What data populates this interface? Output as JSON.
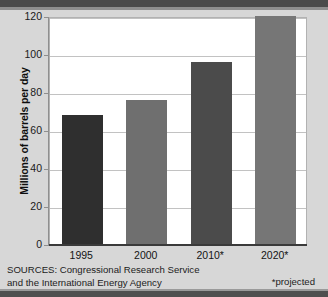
{
  "chart_data": {
    "type": "bar",
    "title": "",
    "subtitle": "",
    "xlabel": "",
    "ylabel": "Millions of barrels per day",
    "categories": [
      "1995",
      "2000",
      "2010*",
      "2020*"
    ],
    "values": [
      68,
      76,
      96,
      120
    ],
    "ylim": [
      0,
      120
    ],
    "y_ticks": [
      "0",
      "20",
      "40",
      "60",
      "80",
      "100",
      "120"
    ],
    "y_tick_values": [
      0,
      20,
      40,
      60,
      80,
      100,
      120
    ],
    "grid": true,
    "legend": "none",
    "bar_colors": [
      "#2f2f2f",
      "#6f6f6f",
      "#4b4b4b",
      "#767676"
    ],
    "annotations": {
      "sources_line1": "SOURCES: Congressional Research Service",
      "sources_line2": "and the International Energy Agency",
      "footnote": "*projected"
    },
    "background_color": "#d7d7d7",
    "plot_background_color": "#ffffff"
  },
  "footer": {
    "sources_line1": "SOURCES: Congressional Research Service",
    "sources_line2": "and the International Energy Agency",
    "projected_note": "*projected"
  }
}
